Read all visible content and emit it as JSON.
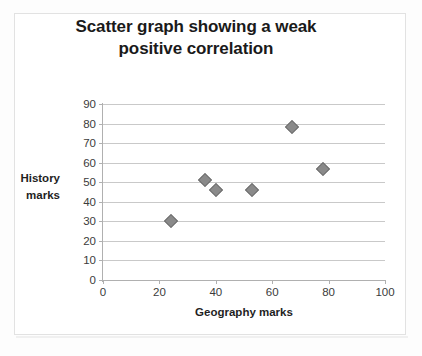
{
  "chart_data": {
    "type": "scatter",
    "title": "Scatter graph showing a weak positive correlation",
    "title_line1": "Scatter graph showing a weak",
    "title_line2": "positive correlation",
    "xlabel": "Geography marks",
    "ylabel": "History marks",
    "ylabel_line1": "History",
    "ylabel_line2": "marks",
    "xlim": [
      0,
      100
    ],
    "ylim": [
      0,
      90
    ],
    "xticks": [
      0,
      20,
      40,
      60,
      80,
      100
    ],
    "yticks": [
      0,
      10,
      20,
      30,
      40,
      50,
      60,
      70,
      80,
      90
    ],
    "grid": "horizontal",
    "legend": "none",
    "marker": "diamond",
    "marker_color": "#8a8a8a",
    "points": [
      {
        "x": 24,
        "y": 30
      },
      {
        "x": 36,
        "y": 51
      },
      {
        "x": 40,
        "y": 46
      },
      {
        "x": 53,
        "y": 46
      },
      {
        "x": 67,
        "y": 78
      },
      {
        "x": 78,
        "y": 57
      }
    ]
  },
  "colors": {
    "title": "#1a1a1a",
    "gridline": "#c9c9c9",
    "axis": "#b0b0b0",
    "tick_label": "#3b3b3b",
    "frame_border": "#e2e2e2",
    "background": "#ffffff"
  }
}
